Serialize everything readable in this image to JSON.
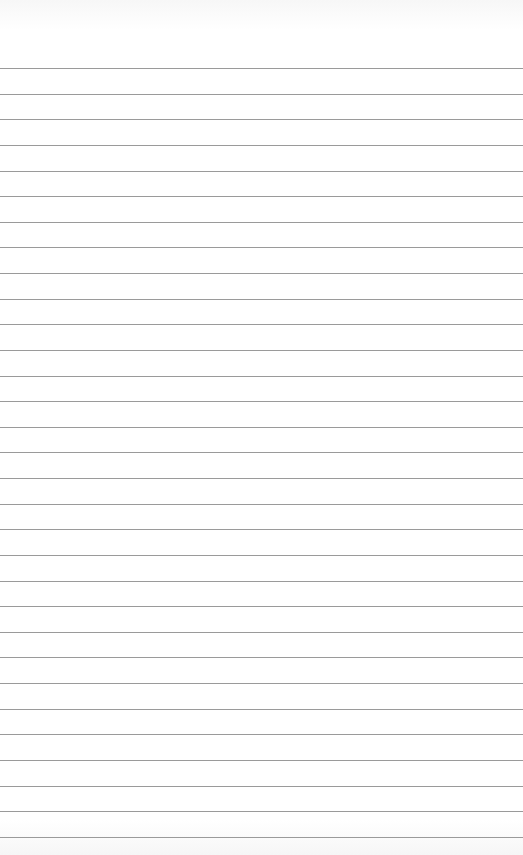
{
  "page": {
    "type": "blank lined paper",
    "background_color": "#ffffff",
    "rule_color": "#9a9a9a",
    "rule_count": 31,
    "first_rule_y": 68,
    "rule_spacing": 25.63
  }
}
